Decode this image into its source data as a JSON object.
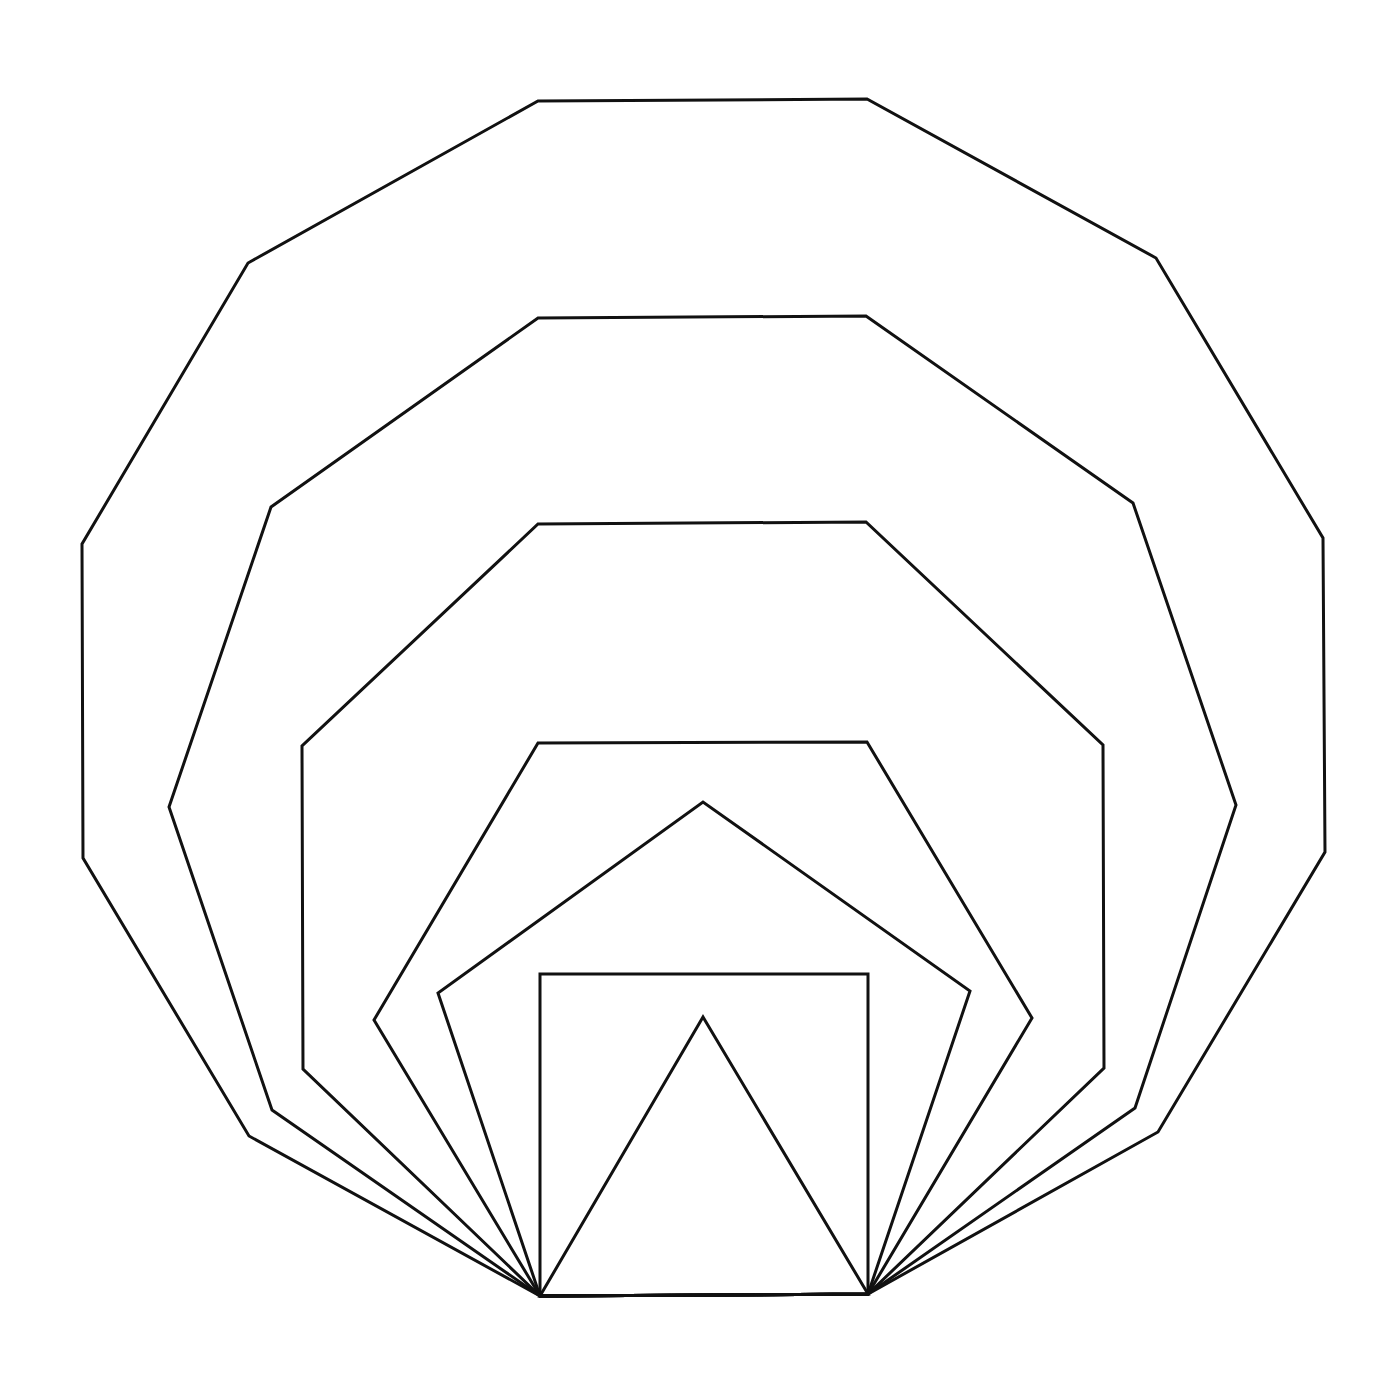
{
  "diagram": {
    "stroke_color": "#111111",
    "background": "#ffffff",
    "shared_base": {
      "from": [
        540,
        1296
      ],
      "to": [
        868,
        1294
      ]
    },
    "polygons": [
      {
        "name": "triangle",
        "sides": 3,
        "points": "540,1296 703,1017 868,1294"
      },
      {
        "name": "square",
        "sides": 4,
        "points": "540,1296 540,974 868,974 868,1294"
      },
      {
        "name": "pentagon",
        "sides": 5,
        "points": "540,1296 438,993 703,802 970,991 868,1294"
      },
      {
        "name": "hexagon",
        "sides": 6,
        "points": "540,1296 374,1020 538,743 867,742 1032,1018 868,1294"
      },
      {
        "name": "heptagon",
        "sides": 7,
        "points": "540,1296 303,1069 302,746 538,524 866,522 1103,745 1104,1068 868,1294"
      },
      {
        "name": "octagon",
        "sides": 8,
        "points": "540,1296 272,1110 169,807 271,507 538,318 866,316 1133,503 1236,805 1135,1108 868,1294"
      },
      {
        "name": "decagon",
        "sides": 10,
        "points": "540,1296 249,1136 83,858 82,544 248,263 538,101 867,99 1156,258 1323,538 1325,852 1158,1132 868,1294"
      }
    ]
  }
}
